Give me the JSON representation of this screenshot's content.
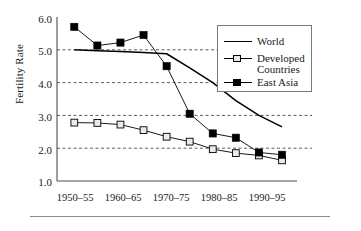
{
  "chart_data": {
    "type": "line",
    "title": "",
    "xlabel": "",
    "ylabel": "Fertility Rate",
    "ylim": [
      1.0,
      6.0
    ],
    "grid": "horizontal-dashed",
    "legend_position": "upper-right",
    "categories": [
      "1950–55",
      "1955–60",
      "1960–65",
      "1965–70",
      "1970–75",
      "1975–80",
      "1980–85",
      "1985–90",
      "1990–95",
      "1995–2000"
    ],
    "visible_tick_labels": [
      "1950–55",
      "1960–65",
      "1970–75",
      "1980–85",
      "1990–95"
    ],
    "ytick_labels": [
      "1.0",
      "2.0",
      "3.0",
      "4.0",
      "5.0",
      "6.0"
    ],
    "ytick_values": [
      1.0,
      2.0,
      3.0,
      4.0,
      5.0,
      6.0
    ],
    "series": [
      {
        "name": "World",
        "marker": "none",
        "color": "#000000",
        "values": [
          5.0,
          4.97,
          4.95,
          4.92,
          4.88,
          4.45,
          4.0,
          3.45,
          3.0,
          2.65
        ]
      },
      {
        "name": "Developed Countries",
        "marker": "open-square",
        "color": "#000000",
        "values": [
          2.78,
          2.77,
          2.72,
          2.55,
          2.35,
          2.2,
          1.97,
          1.85,
          1.78,
          1.63
        ]
      },
      {
        "name": "East Asia",
        "marker": "filled-square",
        "color": "#000000",
        "values": [
          5.7,
          5.13,
          5.22,
          5.45,
          4.5,
          3.05,
          2.45,
          2.32,
          1.87,
          1.8
        ]
      }
    ]
  },
  "legend": {
    "entries": [
      {
        "label": "World",
        "label2": ""
      },
      {
        "label": "Developed",
        "label2": "Countries"
      },
      {
        "label": "East Asia",
        "label2": ""
      }
    ]
  },
  "axis": {
    "y_title": "Fertility Rate"
  }
}
